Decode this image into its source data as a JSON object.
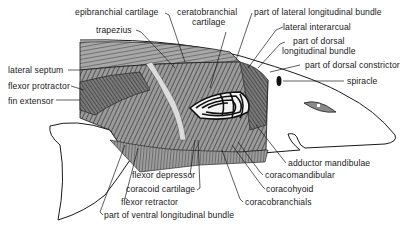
{
  "diagram": {
    "labels": {
      "epibranchial_cartilage": "epibranchial cartilage",
      "ceratobranchial_cartilage_1": "ceratobranchial",
      "ceratobranchial_cartilage_2": "cartilage",
      "part_lateral_longitudinal": "part of lateral longitudinal bundle",
      "trapezius": "trapezius",
      "lateral_interarcual": "lateral interarcual",
      "part_dorsal_longitudinal_1": "part of dorsal",
      "part_dorsal_longitudinal_2": "longitudinal bundle",
      "part_dorsal_constrictor": "part of dorsal constrictor",
      "spiracle": "spiracle",
      "lateral_septum": "lateral septum",
      "flexor_protractor": "flexor protractor",
      "fin_extensor": "fin extensor",
      "adductor_mandibulae": "adductor mandibulae",
      "flexor_depressor": "flexor depressor",
      "coracomandibular": "coracomandibular",
      "coracoid_cartilage": "coracoid cartilage",
      "coracohyoid": "coracohyoid",
      "flexor_retractor": "flexor retractor",
      "coracobranchials": "coracobranchials",
      "part_ventral_longitudinal": "part of ventral longitudinal bundle"
    },
    "colors": {
      "ink": "#1a1a1a",
      "background": "#ffffff",
      "muscle_fill": "#8a8a8a",
      "muscle_dark": "#4a4a4a",
      "cartilage": "#d8d8d8"
    }
  }
}
